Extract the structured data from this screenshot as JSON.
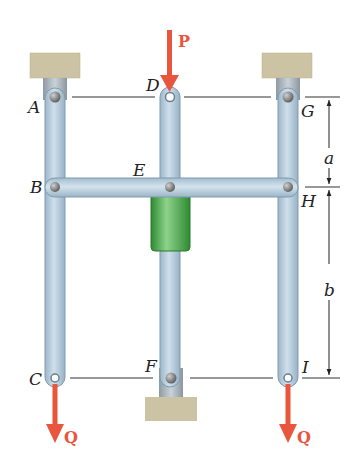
{
  "figure": {
    "points": {
      "A": "A",
      "B": "B",
      "C": "C",
      "D": "D",
      "E": "E",
      "F": "F",
      "G": "G",
      "H": "H",
      "I": "I"
    },
    "dimensions": {
      "upper": "a",
      "lower": "b"
    },
    "forces": {
      "top": "P",
      "left_bottom": "Q",
      "right_bottom": "Q"
    },
    "colors": {
      "link": "#b9cfde",
      "link_edge": "#7f9bb0",
      "support": "#cbc3a3",
      "collar": "#3a9a3c",
      "force": "#e8563e",
      "line": "#222222"
    }
  }
}
